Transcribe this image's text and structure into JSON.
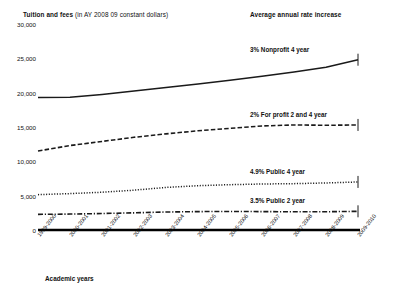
{
  "header": {
    "left_bold": "Tuition and fees",
    "left_light": "(in AY 2008 09 constant dollars)",
    "right": "Average annual rate increase"
  },
  "axis": {
    "x_title": "Academic years",
    "y_ticks": [
      "30,000",
      "25,000",
      "20,000",
      "15,000",
      "10,000",
      "5,000",
      "0"
    ]
  },
  "chart_data": {
    "type": "line",
    "title": "Tuition and fees (in AY 2008 09 constant dollars)",
    "xlabel": "Academic years",
    "ylabel": "Tuition and fees (in AY 2008 09 constant dollars)",
    "ylim": [
      0,
      30000
    ],
    "ytick_values": [
      30000,
      25000,
      20000,
      15000,
      10000,
      5000,
      0
    ],
    "grid": false,
    "legend_position": "right-inline",
    "categories": [
      "1999-2000",
      "2000-2001",
      "2001-2002",
      "2002-2003",
      "2003-2004",
      "2004-2005",
      "2005-2006",
      "2006-2007",
      "2007-2008",
      "2008-2009",
      "2009-2010"
    ],
    "series": [
      {
        "name": "Nonprofit 4 year",
        "label": "3% Nonprofit 4 year",
        "rate": "3%",
        "style": "solid",
        "values": [
          19300,
          19350,
          19750,
          20250,
          20750,
          21250,
          21800,
          22400,
          23000,
          23700,
          24800
        ]
      },
      {
        "name": "For profit 2 and 4 year",
        "label": "2% For profit 2  and 4 year",
        "rate": "2%",
        "style": "dashed",
        "values": [
          11500,
          12300,
          12900,
          13500,
          14000,
          14450,
          14800,
          15150,
          15300,
          15250,
          15300
        ]
      },
      {
        "name": "Public 4 year",
        "label": "4.9% Public 4 year",
        "rate": "4.9%",
        "style": "dotted",
        "values": [
          5150,
          5300,
          5500,
          5800,
          6200,
          6450,
          6600,
          6700,
          6750,
          6850,
          7000
        ]
      },
      {
        "name": "Public 2 year",
        "label": "3.5% Public 2 year",
        "rate": "3.5%",
        "style": "dashdot",
        "values": [
          2280,
          2320,
          2400,
          2500,
          2620,
          2680,
          2700,
          2680,
          2650,
          2660,
          2720
        ]
      }
    ]
  }
}
